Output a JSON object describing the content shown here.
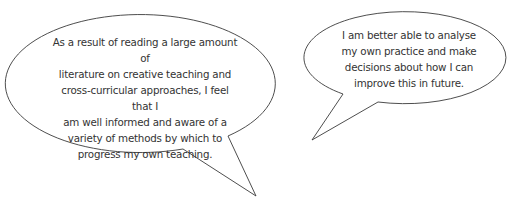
{
  "bubbles": [
    {
      "id": "left",
      "text": "As a result of reading a large amount of literature on creative teaching and cross-curricular approaches, I feel that I am well informed and aware of a variety of methods by which to progress my own teaching.",
      "lines": [
        "As a result of reading a large amount of",
        "literature on creative teaching and",
        "cross-curricular approaches, I feel that I",
        "am well informed and aware of a",
        "variety of methods by which to",
        "progress my own teaching."
      ]
    },
    {
      "id": "right",
      "text": "I am better able to analyse my own practice and make decisions about how I can improve this in future.",
      "lines": [
        "I am better able to analyse",
        "my own practice and make",
        "decisions about how I can",
        "improve this in future."
      ]
    }
  ],
  "colors": {
    "outline": "#3a3a3a",
    "text": "#333333",
    "fill": "#ffffff"
  }
}
